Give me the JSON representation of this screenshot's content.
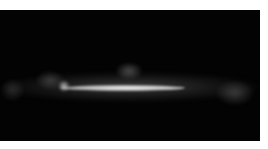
{
  "image": {
    "subject": "Milky Way galactic plane, all-sky view",
    "background_color": "#030303",
    "band_color": "#ffffff",
    "frame_color": "#ffffff"
  }
}
